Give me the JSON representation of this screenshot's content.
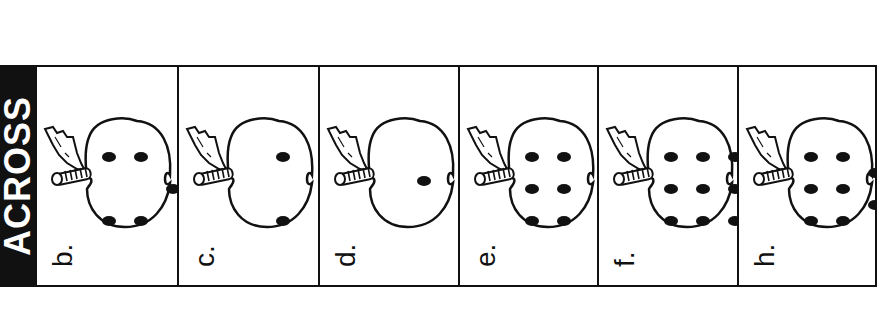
{
  "header": {
    "title": "ACROSS"
  },
  "panels": [
    {
      "label": "b.",
      "dots": 5,
      "layout": [
        [
          0,
          0
        ],
        [
          1,
          0
        ],
        [
          0,
          2
        ],
        [
          1,
          2
        ],
        [
          2,
          1
        ]
      ]
    },
    {
      "label": "c.",
      "dots": 2,
      "layout": [
        [
          1,
          0
        ],
        [
          1,
          2
        ]
      ]
    },
    {
      "label": "d.",
      "dots": 1,
      "layout": [
        [
          1,
          1
        ]
      ]
    },
    {
      "label": "e.",
      "dots": 6,
      "layout": [
        [
          0,
          0
        ],
        [
          1,
          0
        ],
        [
          0,
          1
        ],
        [
          1,
          1
        ],
        [
          0,
          2
        ],
        [
          1,
          2
        ]
      ]
    },
    {
      "label": "f.",
      "dots": 9,
      "layout": [
        [
          0,
          0
        ],
        [
          1,
          0
        ],
        [
          2,
          0
        ],
        [
          0,
          1
        ],
        [
          1,
          1
        ],
        [
          2,
          1
        ],
        [
          0,
          2
        ],
        [
          1,
          2
        ],
        [
          2,
          2
        ]
      ]
    },
    {
      "label": "h.",
      "dots": 8,
      "layout": [
        [
          0,
          0
        ],
        [
          1,
          0
        ],
        [
          0,
          1
        ],
        [
          1,
          1
        ],
        [
          0,
          2
        ],
        [
          1,
          2
        ],
        [
          2,
          0.5
        ],
        [
          2,
          1.5
        ]
      ]
    }
  ],
  "colors": {
    "ink": "#111111",
    "paper": "#ffffff"
  }
}
